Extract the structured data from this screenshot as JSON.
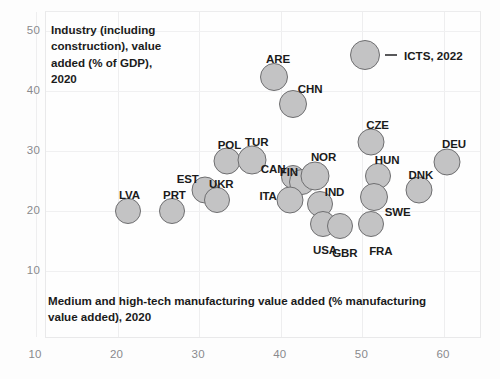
{
  "chart_data": {
    "type": "scatter",
    "title": "",
    "xlabel": "Medium and high-tech manufacturing value added (% manufacturing value added), 2020",
    "ylabel": "Industry (including construction), value added (% of GDP), 2020",
    "xlim": [
      7,
      60.5
    ],
    "ylim": [
      7.5,
      52
    ],
    "xticks": [
      10,
      20,
      30,
      40,
      50,
      60
    ],
    "yticks": [
      10,
      20,
      30,
      40,
      50
    ],
    "grid": true,
    "legend": {
      "position": "top-right",
      "entries": [
        {
          "label": "ICTS, 2022",
          "marker": "bubble-with-dash"
        }
      ]
    },
    "marker_style": {
      "fill": "#c3c3c4",
      "stroke": "#6e6e70",
      "shape": "circle"
    },
    "points": [
      {
        "label": "LVA",
        "x": 21.4,
        "y": 19.9,
        "r": 13,
        "label_dx": -9,
        "label_dy": -22
      },
      {
        "label": "PRT",
        "x": 26.8,
        "y": 19.8,
        "r": 13,
        "label_dx": -9,
        "label_dy": -22
      },
      {
        "label": "EST",
        "x": 30.8,
        "y": 23.4,
        "r": 13.5,
        "label_dx": -28,
        "label_dy": -17
      },
      {
        "label": "UKR",
        "x": 32.3,
        "y": 21.7,
        "r": 13,
        "label_dx": -8,
        "label_dy": -22
      },
      {
        "label": "POL",
        "x": 33.5,
        "y": 28.2,
        "r": 13.5,
        "label_dx": -9,
        "label_dy": -22
      },
      {
        "label": "TUR",
        "x": 36.6,
        "y": 28.4,
        "r": 14.5,
        "label_dx": -7,
        "label_dy": -24
      },
      {
        "label": "ARE",
        "x": 39.3,
        "y": 42.2,
        "r": 14,
        "label_dx": -8,
        "label_dy": -24
      },
      {
        "label": "CHN",
        "x": 41.6,
        "y": 37.7,
        "r": 14,
        "label_dx": 5,
        "label_dy": -21
      },
      {
        "label": "CAN",
        "x": 41.6,
        "y": 25.5,
        "r": 12,
        "label_dx": -32,
        "label_dy": -14
      },
      {
        "label": "FIN",
        "x": 42.7,
        "y": 24.7,
        "r": 13,
        "label_dx": -22,
        "label_dy": -16
      },
      {
        "label": "NOR",
        "x": 44.3,
        "y": 25.6,
        "r": 14.5,
        "label_dx": -4,
        "label_dy": -25
      },
      {
        "label": "ITA",
        "x": 41.3,
        "y": 21.6,
        "r": 13.5,
        "label_dx": -31,
        "label_dy": -10
      },
      {
        "label": "IND",
        "x": 44.9,
        "y": 21.0,
        "r": 13,
        "label_dx": 5,
        "label_dy": -18
      },
      {
        "label": "USA",
        "x": 45.3,
        "y": 17.6,
        "r": 13,
        "label_dx": -10,
        "label_dy": 20
      },
      {
        "label": "GBR",
        "x": 47.4,
        "y": 17.4,
        "r": 13,
        "label_dx": -8,
        "label_dy": 21
      },
      {
        "label": "CZE",
        "x": 51.2,
        "y": 31.4,
        "r": 13.5,
        "label_dx": -5,
        "label_dy": -23
      },
      {
        "label": "HUN",
        "x": 52.0,
        "y": 25.6,
        "r": 13,
        "label_dx": -3,
        "label_dy": -22
      },
      {
        "label": "SWE",
        "x": 51.5,
        "y": 22.2,
        "r": 14,
        "label_dx": 11,
        "label_dy": 9
      },
      {
        "label": "FRA",
        "x": 51.2,
        "y": 17.6,
        "r": 13,
        "label_dx": -2,
        "label_dy": 21
      },
      {
        "label": "DNK",
        "x": 57.0,
        "y": 23.4,
        "r": 13.5,
        "label_dx": -10,
        "label_dy": -21
      },
      {
        "label": "DEU",
        "x": 60.5,
        "y": 28.0,
        "r": 13.5,
        "label_dx": -5,
        "label_dy": -24
      }
    ]
  },
  "axis": {
    "y_title": "Industry (including construction), value added (% of GDP), 2020",
    "x_title": "Medium and high-tech manufacturing value added (% manufacturing value added), 2020"
  },
  "legend": {
    "label": "ICTS, 2022"
  },
  "colors": {
    "marker_fill": "#c3c3c4",
    "marker_stroke": "#6e6e70",
    "tick_text": "#8a8a8d",
    "label_text": "#1b1b1b",
    "grid": "#eeeeef",
    "background": "#fdfdfd"
  }
}
